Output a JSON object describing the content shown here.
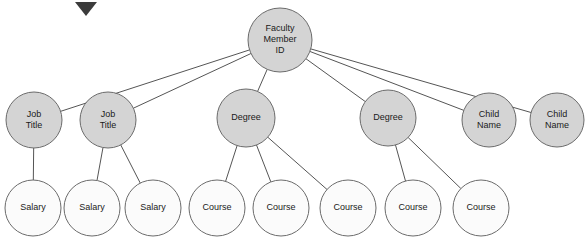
{
  "diagram": {
    "type": "tree",
    "colors": {
      "filled_node_fill": "#d4d4d4",
      "hollow_node_fill": "#fbfbfb",
      "node_stroke": "#6b6b6b",
      "edge_stroke": "#555555",
      "label_color": "#1a1a1a",
      "marker_fill": "#3b3b3b",
      "background": "#ffffff"
    },
    "marker": {
      "name": "diamond-marker",
      "x": 75,
      "y": 2,
      "width": 22,
      "height": 14
    },
    "levels": [
      {
        "index": 0,
        "nodes": [
          {
            "id": "root",
            "label_lines": [
              "Faculty",
              "Member",
              "ID"
            ],
            "cx": 280,
            "cy": 40,
            "r": 32,
            "style": "filled"
          }
        ]
      },
      {
        "index": 1,
        "nodes": [
          {
            "id": "job1",
            "label_lines": [
              "Job",
              "Title"
            ],
            "cx": 34,
            "cy": 120,
            "r": 28,
            "style": "filled"
          },
          {
            "id": "job2",
            "label_lines": [
              "Job",
              "Title"
            ],
            "cx": 108,
            "cy": 120,
            "r": 28,
            "style": "filled"
          },
          {
            "id": "deg1",
            "label_lines": [
              "Degree"
            ],
            "cx": 246,
            "cy": 118,
            "r": 29,
            "style": "filled"
          },
          {
            "id": "deg2",
            "label_lines": [
              "Degree"
            ],
            "cx": 388,
            "cy": 118,
            "r": 28,
            "style": "filled"
          },
          {
            "id": "child1",
            "label_lines": [
              "Child",
              "Name"
            ],
            "cx": 489,
            "cy": 120,
            "r": 27,
            "style": "filled"
          },
          {
            "id": "child2",
            "label_lines": [
              "Child",
              "Name"
            ],
            "cx": 557,
            "cy": 120,
            "r": 27,
            "style": "filled"
          }
        ]
      },
      {
        "index": 2,
        "nodes": [
          {
            "id": "sal1",
            "label_lines": [
              "Salary"
            ],
            "cx": 33,
            "cy": 208,
            "r": 28,
            "style": "hollow"
          },
          {
            "id": "sal2",
            "label_lines": [
              "Salary"
            ],
            "cx": 92,
            "cy": 208,
            "r": 28,
            "style": "hollow"
          },
          {
            "id": "sal3",
            "label_lines": [
              "Salary"
            ],
            "cx": 153,
            "cy": 208,
            "r": 28,
            "style": "hollow"
          },
          {
            "id": "crs1",
            "label_lines": [
              "Course"
            ],
            "cx": 217,
            "cy": 208,
            "r": 28,
            "style": "hollow"
          },
          {
            "id": "crs2",
            "label_lines": [
              "Course"
            ],
            "cx": 281,
            "cy": 208,
            "r": 28,
            "style": "hollow"
          },
          {
            "id": "crs3",
            "label_lines": [
              "Course"
            ],
            "cx": 348,
            "cy": 208,
            "r": 28,
            "style": "hollow"
          },
          {
            "id": "crs4",
            "label_lines": [
              "Course"
            ],
            "cx": 413,
            "cy": 208,
            "r": 28,
            "style": "hollow"
          },
          {
            "id": "crs5",
            "label_lines": [
              "Course"
            ],
            "cx": 481,
            "cy": 208,
            "r": 28,
            "style": "hollow"
          }
        ]
      }
    ],
    "edges": [
      {
        "from": "root",
        "to": "job1"
      },
      {
        "from": "root",
        "to": "job2"
      },
      {
        "from": "root",
        "to": "deg1"
      },
      {
        "from": "root",
        "to": "deg2"
      },
      {
        "from": "root",
        "to": "child1"
      },
      {
        "from": "root",
        "to": "child2"
      },
      {
        "from": "job1",
        "to": "sal1"
      },
      {
        "from": "job2",
        "to": "sal2"
      },
      {
        "from": "job2",
        "to": "sal3"
      },
      {
        "from": "deg1",
        "to": "crs1"
      },
      {
        "from": "deg1",
        "to": "crs2"
      },
      {
        "from": "deg1",
        "to": "crs3"
      },
      {
        "from": "deg2",
        "to": "crs4"
      },
      {
        "from": "deg2",
        "to": "crs5"
      }
    ]
  }
}
